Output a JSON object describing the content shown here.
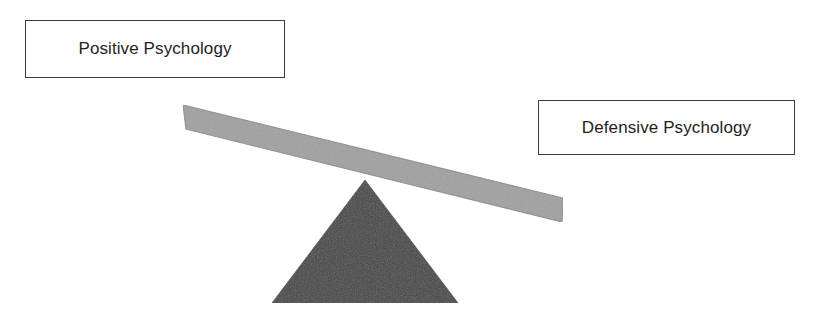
{
  "diagram": {
    "background_color": "#ffffff",
    "width": 821,
    "height": 320
  },
  "labels": {
    "left": {
      "text": "Positive Psychology",
      "border_color": "#3a3a3a",
      "fill_color": "#ffffff",
      "text_color": "#1e1e1e"
    },
    "right": {
      "text": "Defensive Psychology",
      "border_color": "#3a3a3a",
      "fill_color": "#ffffff",
      "text_color": "#1e1e1e"
    }
  },
  "shapes": {
    "beam": {
      "name": "seesaw-beam",
      "fill_color": "#a0a0a0",
      "stroke_color": "#8a8a8a",
      "points": "183,105 563,198 562,222 186,129",
      "tilt": "down-to-the-right"
    },
    "fulcrum": {
      "name": "fulcrum-triangle",
      "fill_color": "#454545",
      "points": "365,180 458,303 272,303"
    }
  }
}
